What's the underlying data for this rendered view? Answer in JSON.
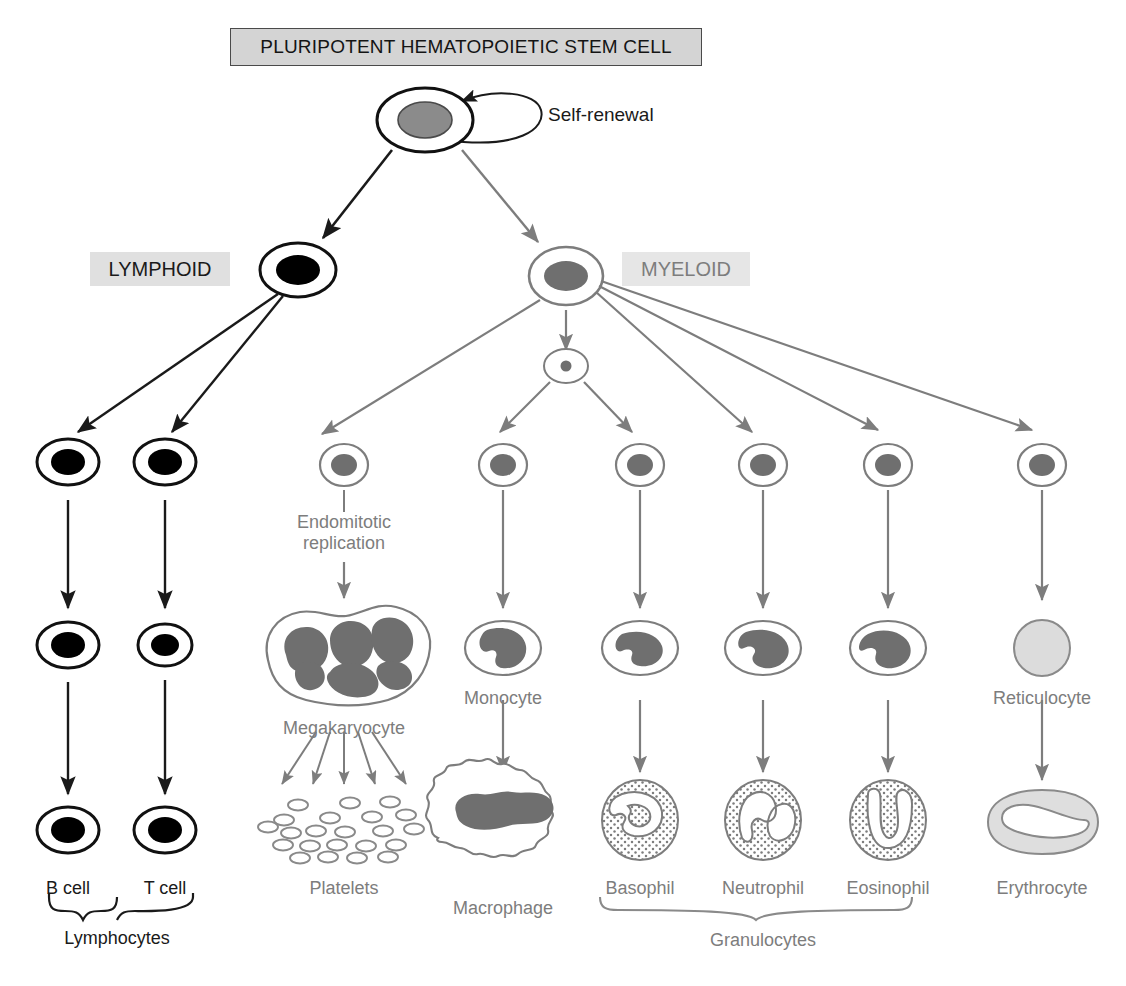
{
  "diagram": {
    "title": "PLURIPOTENT HEMATOPOIETIC STEM CELL",
    "self_renewal_label": "Self-renewal",
    "lineage_labels": {
      "lymphoid": "LYMPHOID",
      "myeloid": "MYELOID"
    },
    "colors": {
      "black_ink": "#1a1a1a",
      "gray_ink": "#7d7d7d",
      "nucleus_gray": "#6f6f6f",
      "title_fill": "#d4d4d4",
      "lymphoid_fill": "#e0e0e0",
      "myeloid_fill": "#e6e6e6",
      "reticulocyte_fill": "#dcdcdc",
      "erythrocyte_fill": "#d9d9d9"
    },
    "process_labels": [
      {
        "id": "endomitotic",
        "line1": "Endomitotic",
        "line2": "replication"
      }
    ],
    "cell_labels": [
      {
        "id": "b-cell",
        "text": "B cell",
        "x": 68,
        "y": 878,
        "tone": "black"
      },
      {
        "id": "t-cell",
        "text": "T cell",
        "x": 165,
        "y": 878,
        "tone": "black"
      },
      {
        "id": "lymphocytes",
        "text": "Lymphocytes",
        "x": 117,
        "y": 928,
        "tone": "black"
      },
      {
        "id": "megakaryocyte",
        "text": "Megakaryocyte",
        "x": 344,
        "y": 718,
        "tone": "gray"
      },
      {
        "id": "platelets",
        "text": "Platelets",
        "x": 344,
        "y": 878,
        "tone": "gray"
      },
      {
        "id": "monocyte",
        "text": "Monocyte",
        "x": 503,
        "y": 688,
        "tone": "gray"
      },
      {
        "id": "macrophage",
        "text": "Macrophage",
        "x": 503,
        "y": 898,
        "tone": "gray"
      },
      {
        "id": "basophil",
        "text": "Basophil",
        "x": 640,
        "y": 878,
        "tone": "gray"
      },
      {
        "id": "neutrophil",
        "text": "Neutrophil",
        "x": 763,
        "y": 878,
        "tone": "gray"
      },
      {
        "id": "eosinophil",
        "text": "Eosinophil",
        "x": 888,
        "y": 878,
        "tone": "gray"
      },
      {
        "id": "granulocytes",
        "text": "Granulocytes",
        "x": 763,
        "y": 930,
        "tone": "gray"
      },
      {
        "id": "reticulocyte",
        "text": "Reticulocyte",
        "x": 1042,
        "y": 688,
        "tone": "gray"
      },
      {
        "id": "erythrocyte",
        "text": "Erythrocyte",
        "x": 1042,
        "y": 878,
        "tone": "gray"
      }
    ],
    "braces": [
      {
        "id": "lymphocytes-brace",
        "label": "Lymphocytes"
      },
      {
        "id": "granulocytes-brace",
        "label": "Granulocytes"
      }
    ],
    "node_count": {
      "myeloid_progenitors": 6,
      "platelet_particles": 22,
      "platelet_arrows": 5
    }
  }
}
